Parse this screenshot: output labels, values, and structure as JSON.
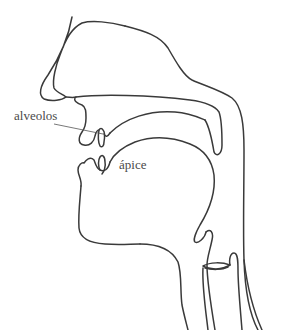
{
  "diagram": {
    "title": "",
    "type": "vocal tract sagittal section",
    "stroke_color": "#3a3a3a",
    "background": "#ffffff",
    "labels": {
      "alveolos": "alveolos",
      "apice": "ápice"
    },
    "parts": [
      "nose",
      "nasal-cavity",
      "hard-palate",
      "velum",
      "upper-lip",
      "upper-incisor",
      "tongue",
      "lower-lip",
      "lower-incisor",
      "chin",
      "pharynx-wall",
      "epiglottis",
      "larynx",
      "vocal-folds",
      "trachea",
      "esophagus"
    ]
  }
}
